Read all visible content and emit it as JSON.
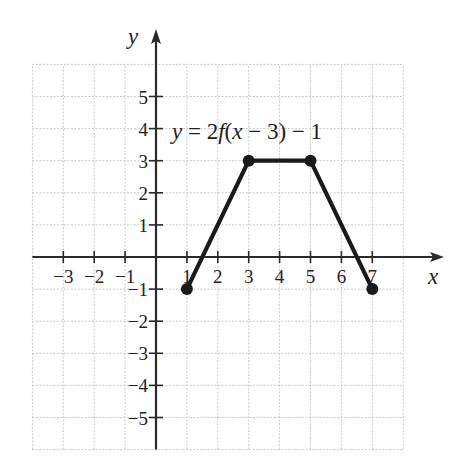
{
  "chart_data": {
    "type": "line",
    "title": "",
    "annotation": {
      "text_parts": [
        "y",
        " = 2",
        "f",
        "(",
        "x",
        " − 3) − 1"
      ],
      "italic_flags": [
        true,
        false,
        true,
        false,
        true,
        false
      ],
      "full_text": "y = 2f(x − 3) − 1"
    },
    "xlabel": "x",
    "ylabel": "y",
    "xlim": [
      -4,
      8
    ],
    "ylim": [
      -6,
      6
    ],
    "grid": true,
    "x_ticks": [
      -3,
      -2,
      -1,
      1,
      2,
      3,
      4,
      5,
      6,
      7
    ],
    "y_ticks": [
      -5,
      -4,
      -3,
      -2,
      -1,
      1,
      2,
      3,
      4,
      5
    ],
    "series": [
      {
        "name": "y = 2f(x − 3) − 1",
        "points": [
          [
            1,
            -1
          ],
          [
            3,
            3
          ],
          [
            5,
            3
          ],
          [
            7,
            -1
          ]
        ],
        "markers": "filled-circle",
        "color": "#1a1a1a"
      }
    ]
  },
  "style": {
    "grid_color": "#c8c8c8",
    "axis_color": "#2a2a2a",
    "line_color": "#1a1a1a",
    "text_color": "#222222"
  },
  "layout": {
    "origin_px": [
      156,
      257
    ],
    "unit_x_px": 30.9,
    "unit_y_px": 32.1
  }
}
